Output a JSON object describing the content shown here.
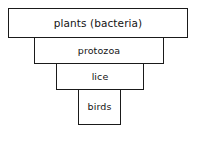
{
  "diagram": {
    "orientation": "inverted-stacked-pyramid",
    "colors": {
      "border": "#1a1a1a",
      "fill": "#ffffff",
      "text": "#141414"
    },
    "levels": [
      {
        "id": "plants",
        "label": "plants (bacteria)",
        "rank": 1
      },
      {
        "id": "protozoa",
        "label": "protozoa",
        "rank": 2
      },
      {
        "id": "lice",
        "label": "lice",
        "rank": 3
      },
      {
        "id": "birds",
        "label": "birds",
        "rank": 4
      }
    ]
  }
}
